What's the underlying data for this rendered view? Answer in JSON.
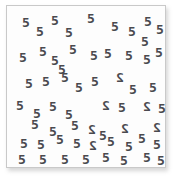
{
  "stimulus": {
    "kind": "visual-search-array",
    "title": "Visual search array of blocky digit glyphs",
    "target_symbol": "2",
    "distractor_symbol": "5",
    "target_count": 7,
    "distractor_count": 53,
    "total_count": 60,
    "glyph_color": "#4a4a4f",
    "card_background": "#fdfdfd",
    "card_border_color": "#c9c9c9",
    "page_background": "#ffffff"
  },
  "glyphs": [
    {
      "symbol": "5",
      "x": 21,
      "y": 15,
      "rotation": 0,
      "mirrored": false
    },
    {
      "symbol": "5",
      "x": 35,
      "y": 24,
      "rotation": 0,
      "mirrored": false
    },
    {
      "symbol": "5",
      "x": 50,
      "y": 13,
      "rotation": 0,
      "mirrored": false
    },
    {
      "symbol": "5",
      "x": 64,
      "y": 25,
      "rotation": 0,
      "mirrored": false
    },
    {
      "symbol": "5",
      "x": 86,
      "y": 11,
      "rotation": 0,
      "mirrored": false
    },
    {
      "symbol": "5",
      "x": 110,
      "y": 19,
      "rotation": 0,
      "mirrored": false
    },
    {
      "symbol": "5",
      "x": 127,
      "y": 24,
      "rotation": 0,
      "mirrored": false
    },
    {
      "symbol": "5",
      "x": 143,
      "y": 14,
      "rotation": 0,
      "mirrored": false
    },
    {
      "symbol": "5",
      "x": 155,
      "y": 22,
      "rotation": 0,
      "mirrored": false
    },
    {
      "symbol": "5",
      "x": 140,
      "y": 34,
      "rotation": 0,
      "mirrored": false
    },
    {
      "symbol": "5",
      "x": 18,
      "y": 50,
      "rotation": 0,
      "mirrored": false
    },
    {
      "symbol": "5",
      "x": 38,
      "y": 44,
      "rotation": 0,
      "mirrored": false
    },
    {
      "symbol": "5",
      "x": 50,
      "y": 53,
      "rotation": 0,
      "mirrored": false
    },
    {
      "symbol": "5",
      "x": 68,
      "y": 42,
      "rotation": 0,
      "mirrored": false
    },
    {
      "symbol": "5",
      "x": 89,
      "y": 48,
      "rotation": 0,
      "mirrored": false
    },
    {
      "symbol": "5",
      "x": 103,
      "y": 46,
      "rotation": 0,
      "mirrored": false
    },
    {
      "symbol": "5",
      "x": 124,
      "y": 48,
      "rotation": 0,
      "mirrored": false
    },
    {
      "symbol": "5",
      "x": 142,
      "y": 52,
      "rotation": 0,
      "mirrored": false
    },
    {
      "symbol": "5",
      "x": 154,
      "y": 45,
      "rotation": 0,
      "mirrored": false
    },
    {
      "symbol": "5",
      "x": 57,
      "y": 62,
      "rotation": 0,
      "mirrored": false
    },
    {
      "symbol": "5",
      "x": 24,
      "y": 76,
      "rotation": 0,
      "mirrored": false
    },
    {
      "symbol": "5",
      "x": 41,
      "y": 74,
      "rotation": 0,
      "mirrored": false
    },
    {
      "symbol": "5",
      "x": 60,
      "y": 70,
      "rotation": 0,
      "mirrored": false
    },
    {
      "symbol": "5",
      "x": 74,
      "y": 80,
      "rotation": 0,
      "mirrored": false
    },
    {
      "symbol": "5",
      "x": 90,
      "y": 74,
      "rotation": 0,
      "mirrored": false
    },
    {
      "symbol": "2",
      "x": 115,
      "y": 70,
      "rotation": 0,
      "mirrored": true
    },
    {
      "symbol": "5",
      "x": 128,
      "y": 82,
      "rotation": 0,
      "mirrored": false
    },
    {
      "symbol": "5",
      "x": 148,
      "y": 80,
      "rotation": 0,
      "mirrored": false
    },
    {
      "symbol": "5",
      "x": 15,
      "y": 98,
      "rotation": 0,
      "mirrored": false
    },
    {
      "symbol": "5",
      "x": 32,
      "y": 106,
      "rotation": 0,
      "mirrored": false
    },
    {
      "symbol": "5",
      "x": 48,
      "y": 99,
      "rotation": 0,
      "mirrored": false
    },
    {
      "symbol": "5",
      "x": 64,
      "y": 107,
      "rotation": 0,
      "mirrored": false
    },
    {
      "symbol": "2",
      "x": 101,
      "y": 98,
      "rotation": 0,
      "mirrored": true
    },
    {
      "symbol": "5",
      "x": 117,
      "y": 100,
      "rotation": 0,
      "mirrored": false
    },
    {
      "symbol": "2",
      "x": 142,
      "y": 99,
      "rotation": 0,
      "mirrored": true
    },
    {
      "symbol": "5",
      "x": 157,
      "y": 101,
      "rotation": 0,
      "mirrored": false
    },
    {
      "symbol": "5",
      "x": 30,
      "y": 117,
      "rotation": 0,
      "mirrored": false
    },
    {
      "symbol": "5",
      "x": 48,
      "y": 124,
      "rotation": 0,
      "mirrored": false
    },
    {
      "symbol": "5",
      "x": 70,
      "y": 118,
      "rotation": 0,
      "mirrored": false
    },
    {
      "symbol": "2",
      "x": 87,
      "y": 122,
      "rotation": 0,
      "mirrored": true
    },
    {
      "symbol": "5",
      "x": 98,
      "y": 128,
      "rotation": 0,
      "mirrored": false
    },
    {
      "symbol": "2",
      "x": 120,
      "y": 121,
      "rotation": 0,
      "mirrored": true
    },
    {
      "symbol": "2",
      "x": 152,
      "y": 120,
      "rotation": 0,
      "mirrored": true
    },
    {
      "symbol": "5",
      "x": 137,
      "y": 131,
      "rotation": 0,
      "mirrored": false
    },
    {
      "symbol": "5",
      "x": 19,
      "y": 136,
      "rotation": 0,
      "mirrored": false
    },
    {
      "symbol": "5",
      "x": 36,
      "y": 137,
      "rotation": 0,
      "mirrored": false
    },
    {
      "symbol": "5",
      "x": 55,
      "y": 132,
      "rotation": 0,
      "mirrored": false
    },
    {
      "symbol": "5",
      "x": 72,
      "y": 136,
      "rotation": 0,
      "mirrored": false
    },
    {
      "symbol": "2",
      "x": 88,
      "y": 138,
      "rotation": 0,
      "mirrored": true
    },
    {
      "symbol": "5",
      "x": 106,
      "y": 134,
      "rotation": 0,
      "mirrored": false
    },
    {
      "symbol": "5",
      "x": 124,
      "y": 139,
      "rotation": 0,
      "mirrored": false
    },
    {
      "symbol": "5",
      "x": 152,
      "y": 137,
      "rotation": 0,
      "mirrored": false
    },
    {
      "symbol": "5",
      "x": 17,
      "y": 152,
      "rotation": 0,
      "mirrored": false
    },
    {
      "symbol": "5",
      "x": 38,
      "y": 152,
      "rotation": 0,
      "mirrored": false
    },
    {
      "symbol": "5",
      "x": 60,
      "y": 152,
      "rotation": 0,
      "mirrored": false
    },
    {
      "symbol": "5",
      "x": 81,
      "y": 152,
      "rotation": 0,
      "mirrored": false
    },
    {
      "symbol": "5",
      "x": 101,
      "y": 150,
      "rotation": 0,
      "mirrored": false
    },
    {
      "symbol": "5",
      "x": 119,
      "y": 153,
      "rotation": 0,
      "mirrored": false
    },
    {
      "symbol": "5",
      "x": 142,
      "y": 150,
      "rotation": 0,
      "mirrored": false
    },
    {
      "symbol": "5",
      "x": 156,
      "y": 153,
      "rotation": 0,
      "mirrored": false
    }
  ]
}
